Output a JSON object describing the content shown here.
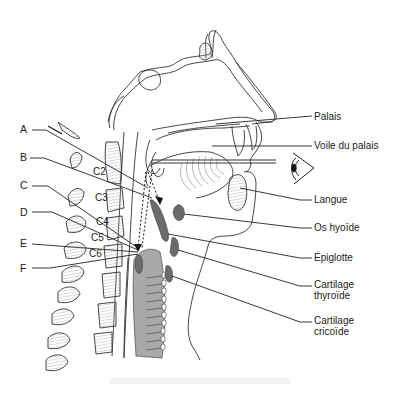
{
  "diagram": {
    "type": "anatomical-sagittal-section",
    "colors": {
      "line": "#333333",
      "hatch": "#bbbbbb",
      "cartilage_dark": "#6b6b6b",
      "airway_grey": "#a9a9a9",
      "background": "#ffffff"
    },
    "left_labels": [
      {
        "id": "A",
        "text": "A"
      },
      {
        "id": "B",
        "text": "B"
      },
      {
        "id": "C",
        "text": "C"
      },
      {
        "id": "D",
        "text": "D"
      },
      {
        "id": "E",
        "text": "E"
      },
      {
        "id": "F",
        "text": "F"
      }
    ],
    "vertebra_labels": [
      {
        "id": "C2",
        "text": "C2"
      },
      {
        "id": "C3",
        "text": "C3"
      },
      {
        "id": "C4",
        "text": "C4"
      },
      {
        "id": "C5",
        "text": "C5"
      },
      {
        "id": "C6",
        "text": "C6"
      }
    ],
    "right_labels": [
      {
        "id": "palais",
        "text": "Palais"
      },
      {
        "id": "voile",
        "text": "Voile du palais"
      },
      {
        "id": "langue",
        "text": "Langue"
      },
      {
        "id": "hyoide",
        "text": "Os hyoïde"
      },
      {
        "id": "epiglotte",
        "text": "Épiglotte"
      },
      {
        "id": "thyroide_1",
        "text": "Cartilage"
      },
      {
        "id": "thyroide_2",
        "text": "thyroïde"
      },
      {
        "id": "cricoide_1",
        "text": "Cartilage"
      },
      {
        "id": "cricoide_2",
        "text": "cricoïde"
      }
    ],
    "icons": {
      "eye": "eye-icon"
    }
  }
}
